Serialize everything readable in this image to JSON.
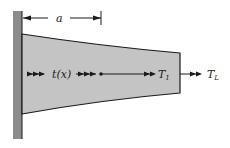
{
  "figure": {
    "dimension_label": "a",
    "distributed_load_label": "t(x)",
    "internal_force_label": {
      "base": "T",
      "subscript": "1"
    },
    "end_load_label": {
      "base": "T",
      "subscript": "L"
    }
  },
  "colors": {
    "wall": "#8c8c8c",
    "bar_fill": "#c4c4c4",
    "outline": "#1a1a1a",
    "background": "#ffffff"
  }
}
